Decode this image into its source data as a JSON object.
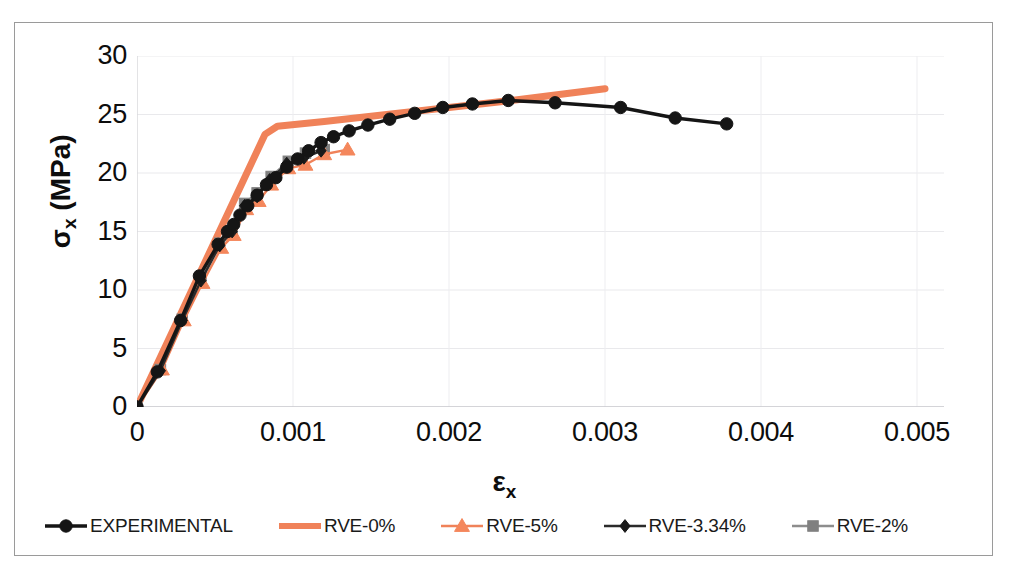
{
  "chart_data": {
    "type": "line",
    "title": "",
    "xlabel": "εx",
    "ylabel": "σx (MPa)",
    "xlim": [
      0,
      0.005
    ],
    "ylim": [
      0,
      30
    ],
    "xticks": [
      "0",
      "0.001",
      "0.002",
      "0.003",
      "0.004",
      "0.005"
    ],
    "xtick_values": [
      0,
      0.001,
      0.002,
      0.003,
      0.004,
      0.005
    ],
    "yticks": [
      "0",
      "5",
      "10",
      "15",
      "20",
      "25",
      "30"
    ],
    "ytick_values": [
      0,
      5,
      10,
      15,
      20,
      25,
      30
    ],
    "grid": true,
    "legend_position": "bottom",
    "series": [
      {
        "name": "EXPERIMENTAL",
        "color": "#151515",
        "marker": "circle",
        "marker_color": "#151515",
        "points": [
          [
            0.0,
            0.0
          ],
          [
            0.00013,
            3.0
          ],
          [
            0.00028,
            7.4
          ],
          [
            0.0004,
            11.2
          ],
          [
            0.00052,
            13.9
          ],
          [
            0.00058,
            15.0
          ],
          [
            0.00062,
            15.6
          ],
          [
            0.00066,
            16.4
          ],
          [
            0.00071,
            17.2
          ],
          [
            0.00077,
            18.1
          ],
          [
            0.00083,
            19.0
          ],
          [
            0.00089,
            19.6
          ],
          [
            0.00096,
            20.5
          ],
          [
            0.00103,
            21.2
          ],
          [
            0.0011,
            21.9
          ],
          [
            0.00118,
            22.6
          ],
          [
            0.00126,
            23.1
          ],
          [
            0.00136,
            23.6
          ],
          [
            0.00148,
            24.1
          ],
          [
            0.00162,
            24.6
          ],
          [
            0.00178,
            25.1
          ],
          [
            0.00196,
            25.6
          ],
          [
            0.00215,
            25.9
          ],
          [
            0.00238,
            26.2
          ],
          [
            0.00268,
            26.0
          ],
          [
            0.0031,
            25.6
          ],
          [
            0.00345,
            24.7
          ],
          [
            0.00378,
            24.2
          ]
        ]
      },
      {
        "name": "RVE-0%",
        "color": "#F08259",
        "marker": "none",
        "marker_color": "#F08259",
        "points": [
          [
            0.0,
            0.0
          ],
          [
            0.00082,
            23.3
          ],
          [
            0.0009,
            24.0
          ],
          [
            0.0012,
            24.4
          ],
          [
            0.0018,
            25.3
          ],
          [
            0.0024,
            26.2
          ],
          [
            0.003,
            27.2
          ]
        ]
      },
      {
        "name": "RVE-5%",
        "color": "#F08259",
        "marker": "triangle",
        "marker_color": "#F4875C",
        "points": [
          [
            0.0,
            0.0
          ],
          [
            0.00016,
            3.2
          ],
          [
            0.0003,
            7.4
          ],
          [
            0.00042,
            10.6
          ],
          [
            0.00054,
            13.6
          ],
          [
            0.00062,
            14.7
          ],
          [
            0.0007,
            16.9
          ],
          [
            0.00078,
            17.6
          ],
          [
            0.00086,
            19.0
          ],
          [
            0.00097,
            20.4
          ],
          [
            0.00108,
            20.7
          ],
          [
            0.0012,
            21.6
          ],
          [
            0.00135,
            22.0
          ]
        ]
      },
      {
        "name": "RVE-3.34%",
        "color": "#2b2b2b",
        "marker": "diamond",
        "marker_color": "#1a1a1a",
        "points": [
          [
            0.0,
            0.0
          ],
          [
            0.00015,
            3.1
          ],
          [
            0.00029,
            7.4
          ],
          [
            0.00041,
            10.8
          ],
          [
            0.00053,
            13.8
          ],
          [
            0.00061,
            15.0
          ],
          [
            0.00069,
            17.2
          ],
          [
            0.00077,
            18.0
          ],
          [
            0.00085,
            19.4
          ],
          [
            0.00096,
            20.8
          ],
          [
            0.00107,
            21.3
          ],
          [
            0.00118,
            21.9
          ]
        ]
      },
      {
        "name": "RVE-2%",
        "color": "#8d8d8d",
        "marker": "square",
        "marker_color": "#808080",
        "points": [
          [
            0.0,
            0.0
          ],
          [
            0.00015,
            3.2
          ],
          [
            0.00029,
            7.5
          ],
          [
            0.00041,
            11.1
          ],
          [
            0.00053,
            14.0
          ],
          [
            0.00061,
            15.1
          ],
          [
            0.00069,
            17.4
          ],
          [
            0.00077,
            18.3
          ],
          [
            0.00086,
            19.7
          ],
          [
            0.00097,
            21.0
          ],
          [
            0.00108,
            21.7
          ],
          [
            0.0012,
            22.0
          ]
        ]
      }
    ]
  },
  "legend": {
    "items": [
      {
        "label": "EXPERIMENTAL",
        "color": "#151515",
        "marker": "circle"
      },
      {
        "label": "RVE-0%",
        "color": "#F08259",
        "marker": "none"
      },
      {
        "label": "RVE-5%",
        "color": "#F08259",
        "marker": "triangle"
      },
      {
        "label": "RVE-3.34%",
        "color": "#2b2b2b",
        "marker": "diamond"
      },
      {
        "label": "RVE-2%",
        "color": "#8d8d8d",
        "marker": "square"
      }
    ]
  },
  "axes": {
    "y_title_main": "σ",
    "y_title_sub": "x",
    "y_title_unit": " (MPa)",
    "x_title_main": "ε",
    "x_title_sub": "x"
  }
}
